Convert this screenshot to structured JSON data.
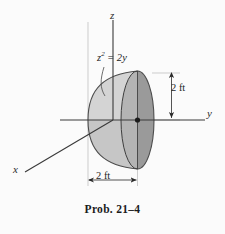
{
  "figure": {
    "caption": "Prob. 21–4",
    "background_color": "#fbfbfb",
    "axes": {
      "z_label": "z",
      "y_label": "y",
      "x_label": "x",
      "line_color": "#3a3a3a"
    },
    "equation": {
      "base": "z",
      "superscript": "2",
      "operator": " = ",
      "right": "2y"
    },
    "dimensions": {
      "vertical": "2 ft",
      "horizontal": "2 ft"
    },
    "solid": {
      "name": "paraboloid-of-revolution",
      "fill_light": "#d2d2d2",
      "fill_mid": "#c0c0c0",
      "fill_dark": "#8c8c8c",
      "fill_darker": "#7e7e7e",
      "outline_color": "#4a4a4a"
    },
    "origin_marker_color": "#1c1c1c"
  }
}
